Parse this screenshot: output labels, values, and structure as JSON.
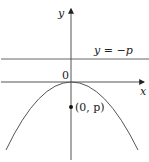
{
  "diagram": {
    "type": "parabola-directrix-focus",
    "axes": {
      "x_label": "x",
      "y_label": "y",
      "origin_label": "0"
    },
    "directrix": {
      "label": "y = −p"
    },
    "focus": {
      "label": "(0, p)"
    },
    "colors": {
      "line": "#555555",
      "text": "#222222"
    }
  }
}
